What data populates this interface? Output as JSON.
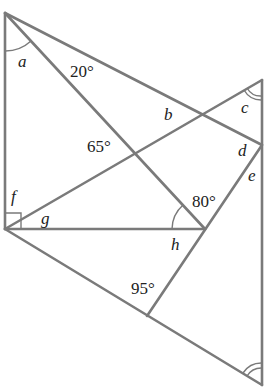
{
  "diagram": {
    "type": "geometry-angles",
    "line_color": "#7a7a7a",
    "points": {
      "A": [
        5,
        13
      ],
      "P": [
        5,
        229
      ],
      "C": [
        262,
        80
      ],
      "D": [
        262,
        145
      ],
      "H": [
        205,
        229
      ],
      "Q": [
        147,
        316
      ],
      "R": [
        262,
        385
      ]
    },
    "lines": [
      {
        "from": "A",
        "to": "P"
      },
      {
        "from": "A",
        "to": "D"
      },
      {
        "from": "A",
        "to": "H"
      },
      {
        "from": "P",
        "to": "C"
      },
      {
        "from": "P",
        "to": "H"
      },
      {
        "from": "P",
        "to": "R"
      },
      {
        "from": "D",
        "to": "Q"
      },
      {
        "from": "C",
        "to": "R"
      }
    ],
    "labels": {
      "a": "a",
      "b": "b",
      "c": "c",
      "d": "d",
      "e": "e",
      "f": "f",
      "g": "g",
      "h": "h",
      "angle_20": "20°",
      "angle_65": "65°",
      "angle_80": "80°",
      "angle_95": "95°"
    },
    "right_angle_marker": "P"
  }
}
